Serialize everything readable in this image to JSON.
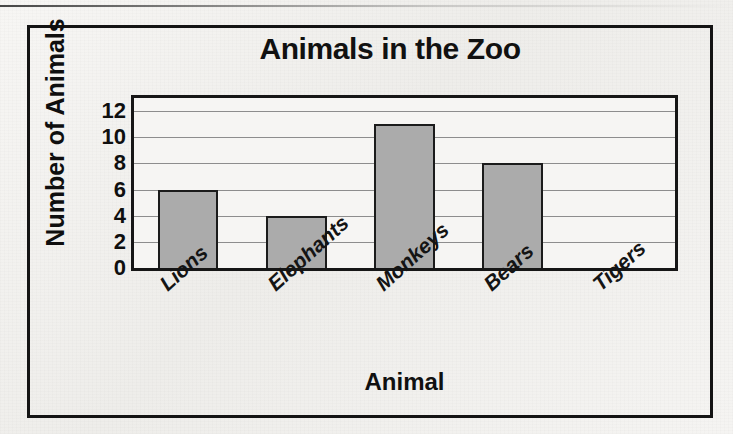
{
  "chart_data": {
    "type": "bar",
    "title": "Animals in the Zoo",
    "xlabel": "Animal",
    "ylabel": "Number of Animals",
    "categories": [
      "Lions",
      "Elephants",
      "Monkeys",
      "Bears",
      "Tigers"
    ],
    "values": [
      6,
      4,
      11,
      8,
      0
    ],
    "ylim": [
      0,
      13
    ],
    "yticks": [
      0,
      2,
      4,
      6,
      8,
      10,
      12
    ],
    "ytick_labels": [
      "0",
      "2",
      "4",
      "6",
      "8",
      "10",
      "12"
    ],
    "grid": "horizontal",
    "legend": "none",
    "bar_color": "#ababab",
    "bar_edge_color": "#1b1b1b",
    "gridline_color": "#8d8d8d",
    "frame_color": "#141414",
    "background_color": "#f4f3f1",
    "xtick_rotation": -42
  }
}
